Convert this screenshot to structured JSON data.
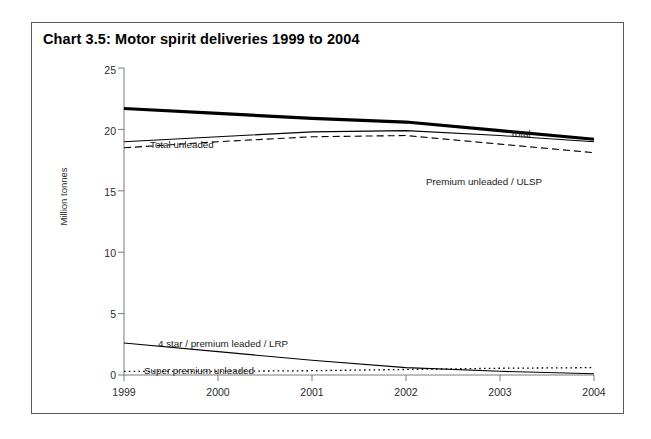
{
  "figure": {
    "title": "Chart 3.5:  Motor spirit deliveries 1999 to 2004",
    "border_color": "#5a5a5a",
    "background": "#ffffff"
  },
  "chart_data": {
    "type": "line",
    "title": "Chart 3.5:  Motor spirit deliveries 1999 to 2004",
    "xlabel": "",
    "ylabel": "Million tonnes",
    "x": [
      1999,
      2000,
      2001,
      2002,
      2003,
      2004
    ],
    "xtick_labels": [
      "1999",
      "2000",
      "2001",
      "2002",
      "2003",
      "2004"
    ],
    "xlim": [
      1999,
      2004
    ],
    "ylim": [
      0,
      25
    ],
    "ytick_labels": [
      "0",
      "5",
      "10",
      "15",
      "20",
      "25"
    ],
    "ytick_values": [
      0,
      5,
      10,
      15,
      20,
      25
    ],
    "grid": false,
    "legend_position": "inline-annotations",
    "series": [
      {
        "name": "Total",
        "style": "thick-solid",
        "color": "#000000",
        "values": [
          21.7,
          21.3,
          20.9,
          20.6,
          19.9,
          19.2
        ],
        "label": "Total",
        "label_x": 478,
        "label_y": 113
      },
      {
        "name": "Total unleaded",
        "style": "thin-solid",
        "color": "#000000",
        "values": [
          19.0,
          19.4,
          19.8,
          19.9,
          19.5,
          19.0
        ],
        "label": "Total unleaded",
        "label_x": 118,
        "label_y": 123
      },
      {
        "name": "Premium unleaded / ULSP",
        "style": "dashed",
        "color": "#000000",
        "values": [
          18.5,
          19.0,
          19.4,
          19.5,
          18.8,
          18.1
        ],
        "label": "Premium unleaded /  ULSP",
        "label_x": 394,
        "label_y": 160
      },
      {
        "name": "4 star / premium leaded / LRP",
        "style": "thin-solid",
        "color": "#000000",
        "values": [
          2.6,
          1.9,
          1.2,
          0.6,
          0.3,
          0.1
        ],
        "label": "4 star / premium leaded / LRP",
        "label_x": 126,
        "label_y": 322
      },
      {
        "name": "Super premium unleaded",
        "style": "dotted",
        "color": "#000000",
        "values": [
          0.3,
          0.3,
          0.35,
          0.45,
          0.55,
          0.6
        ],
        "label": "Super premium unleaded",
        "label_x": 112,
        "label_y": 349
      }
    ]
  }
}
